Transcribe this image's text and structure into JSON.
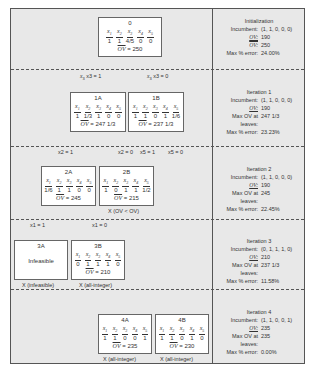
{
  "tree": {
    "levels": [
      {
        "nodes": [
          {
            "id": "0",
            "vars": [
              "x1",
              "x2",
              "x3",
              "x4",
              "x5"
            ],
            "values": [
              "1",
              "1",
              "4/5",
              "0",
              "0"
            ],
            "ov_label": "OV",
            "ov_value": "250"
          }
        ]
      },
      {
        "branches": [
          "x3 = 1",
          "x3 = 0"
        ],
        "nodes": [
          {
            "id": "1A",
            "vars": [
              "x1",
              "x2",
              "x3",
              "x4",
              "x5"
            ],
            "values": [
              "1",
              "1/3",
              "1",
              "0",
              "0"
            ],
            "ov_label": "OV",
            "ov_value": "247 1/3"
          },
          {
            "id": "1B",
            "vars": [
              "x1",
              "x2",
              "x3",
              "x4",
              "x5"
            ],
            "values": [
              "1",
              "1",
              "0",
              "1",
              "1/6"
            ],
            "ov_label": "OV",
            "ov_value": "237 1/3"
          }
        ]
      },
      {
        "branches": [
          "x2 = 1",
          "x2 = 0",
          "x5 = 1",
          "x5 = 0"
        ],
        "nodes": [
          {
            "id": "2A",
            "vars": [
              "x1",
              "x2",
              "x3",
              "x4",
              "x5"
            ],
            "values": [
              "1/6",
              "1",
              "1",
              "0",
              "0"
            ],
            "ov_label": "OV",
            "ov_value": "245"
          },
          {
            "id": "2B",
            "vars": [
              "x1",
              "x2",
              "x3",
              "x4",
              "x5"
            ],
            "values": [
              "1",
              "0",
              "1",
              "1",
              "1/2"
            ],
            "ov_label": "OV",
            "ov_value": "215",
            "note": "X (OV < OV)"
          }
        ]
      },
      {
        "branches": [
          "x1 = 1",
          "x1 = 0"
        ],
        "nodes": [
          {
            "id": "3A",
            "text": "Infeasible",
            "note": "X (infeasible)"
          },
          {
            "id": "3B",
            "vars": [
              "x1",
              "x2",
              "x3",
              "x4",
              "x5"
            ],
            "values": [
              "0",
              "1",
              "1",
              "1",
              "0"
            ],
            "ov_label": "OV",
            "ov_value": "210",
            "note": "X (all-integer)"
          }
        ]
      },
      {
        "nodes": [
          {
            "id": "4A",
            "vars": [
              "x1",
              "x2",
              "x3",
              "x4",
              "x5"
            ],
            "values": [
              "1",
              "1",
              "0",
              "0",
              "1"
            ],
            "ov_label": "OV",
            "ov_value": "235",
            "note": "X (all-integer)"
          },
          {
            "id": "4B",
            "vars": [
              "x1",
              "x2",
              "x3",
              "x4",
              "x5"
            ],
            "values": [
              "1",
              "1",
              "0",
              "1",
              "0"
            ],
            "ov_label": "OV",
            "ov_value": "230",
            "note": "X (all-integer)"
          }
        ]
      }
    ]
  },
  "stats": [
    {
      "title": "Initialization",
      "rows": [
        [
          "Incumbent:",
          "(1, 1, 0, 0, 0)"
        ],
        [
          "OV:",
          "190"
        ],
        [
          "OV:",
          "250"
        ],
        [
          "Max % error:",
          "24.00%"
        ]
      ]
    },
    {
      "title": "Iteration 1",
      "rows": [
        [
          "Incumbent:",
          "(1, 1, 0, 0, 0)"
        ],
        [
          "OV:",
          "190"
        ],
        [
          "Max OV at leaves:",
          "247 1/3"
        ],
        [
          "Max % error:",
          "23.23%"
        ]
      ]
    },
    {
      "title": "Iteration 2",
      "rows": [
        [
          "Incumbent:",
          "(1, 1, 0, 0, 0)"
        ],
        [
          "OV:",
          "190"
        ],
        [
          "Max OV at leaves:",
          "245"
        ],
        [
          "Max % error:",
          "22.45%"
        ]
      ]
    },
    {
      "title": "Iteration 3",
      "rows": [
        [
          "Incumbent:",
          "(0, 1, 1, 1, 0)"
        ],
        [
          "OV:",
          "210"
        ],
        [
          "Max OV at leaves:",
          "237 1/3"
        ],
        [
          "Max % error:",
          "11.58%"
        ]
      ]
    },
    {
      "title": "Iteration 4",
      "rows": [
        [
          "Incumbent:",
          "(1, 1, 0, 0, 1)"
        ],
        [
          "OV:",
          "235"
        ],
        [
          "Max OV at leaves:",
          "235"
        ],
        [
          "Max % error:",
          "0.00%"
        ]
      ]
    }
  ],
  "sub": {
    "x1": "1",
    "x2": "2",
    "x3": "3",
    "x4": "4",
    "x5": "5"
  }
}
